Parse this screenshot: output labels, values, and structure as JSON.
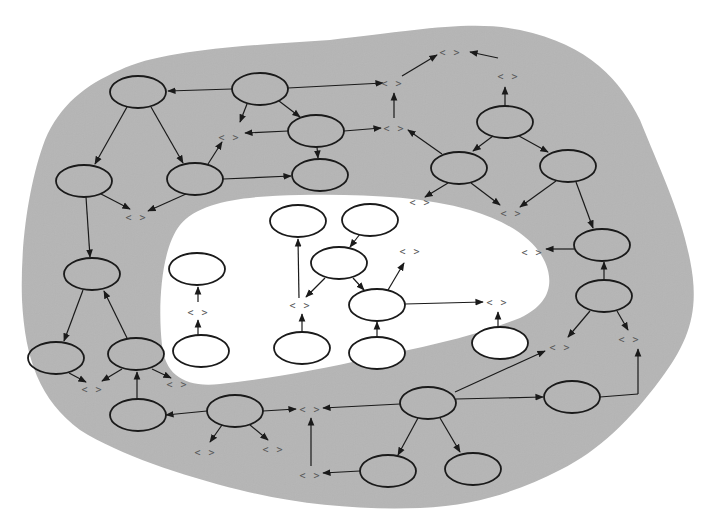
{
  "diagram": {
    "title": "",
    "colors": {
      "outer_region": "#b5b5b5",
      "inner_region": "#ffffff",
      "background": "#ffffff",
      "stroke": "#1a1a1a",
      "terminal_text": "#555555"
    },
    "terminal_label": "< >",
    "regions": [
      {
        "id": "outer",
        "label": "",
        "fill": "#b5b5b5"
      },
      {
        "id": "inner",
        "label": "",
        "fill": "#ffffff"
      }
    ],
    "nodes": [
      {
        "id": "n1",
        "cx": 138,
        "cy": 92,
        "rx": 28,
        "ry": 16,
        "region": "outer"
      },
      {
        "id": "n2",
        "cx": 260,
        "cy": 89,
        "rx": 28,
        "ry": 16,
        "region": "outer"
      },
      {
        "id": "n3",
        "cx": 316,
        "cy": 131,
        "rx": 28,
        "ry": 16,
        "region": "outer"
      },
      {
        "id": "n4",
        "cx": 320,
        "cy": 175,
        "rx": 28,
        "ry": 16,
        "region": "outer"
      },
      {
        "id": "n5",
        "cx": 84,
        "cy": 181,
        "rx": 28,
        "ry": 16,
        "region": "outer"
      },
      {
        "id": "n6",
        "cx": 195,
        "cy": 179,
        "rx": 28,
        "ry": 16,
        "region": "outer"
      },
      {
        "id": "n7",
        "cx": 505,
        "cy": 122,
        "rx": 28,
        "ry": 16,
        "region": "outer"
      },
      {
        "id": "n8",
        "cx": 459,
        "cy": 168,
        "rx": 28,
        "ry": 16,
        "region": "outer"
      },
      {
        "id": "n9",
        "cx": 568,
        "cy": 166,
        "rx": 28,
        "ry": 16,
        "region": "outer"
      },
      {
        "id": "n10",
        "cx": 602,
        "cy": 245,
        "rx": 28,
        "ry": 16,
        "region": "outer"
      },
      {
        "id": "n11",
        "cx": 604,
        "cy": 296,
        "rx": 28,
        "ry": 16,
        "region": "outer"
      },
      {
        "id": "n12",
        "cx": 92,
        "cy": 274,
        "rx": 28,
        "ry": 16,
        "region": "outer"
      },
      {
        "id": "n13",
        "cx": 56,
        "cy": 358,
        "rx": 28,
        "ry": 16,
        "region": "outer"
      },
      {
        "id": "n14",
        "cx": 136,
        "cy": 354,
        "rx": 28,
        "ry": 16,
        "region": "outer"
      },
      {
        "id": "n15",
        "cx": 138,
        "cy": 415,
        "rx": 28,
        "ry": 16,
        "region": "outer"
      },
      {
        "id": "n16",
        "cx": 235,
        "cy": 411,
        "rx": 28,
        "ry": 16,
        "region": "outer"
      },
      {
        "id": "n17",
        "cx": 428,
        "cy": 403,
        "rx": 28,
        "ry": 16,
        "region": "outer"
      },
      {
        "id": "n18",
        "cx": 572,
        "cy": 397,
        "rx": 28,
        "ry": 16,
        "region": "outer"
      },
      {
        "id": "n19",
        "cx": 388,
        "cy": 471,
        "rx": 28,
        "ry": 16,
        "region": "outer"
      },
      {
        "id": "n20",
        "cx": 473,
        "cy": 469,
        "rx": 28,
        "ry": 16,
        "region": "outer"
      },
      {
        "id": "i1",
        "cx": 197,
        "cy": 269,
        "rx": 28,
        "ry": 16,
        "region": "inner"
      },
      {
        "id": "i2",
        "cx": 298,
        "cy": 221,
        "rx": 28,
        "ry": 16,
        "region": "inner"
      },
      {
        "id": "i3",
        "cx": 370,
        "cy": 220,
        "rx": 28,
        "ry": 16,
        "region": "inner"
      },
      {
        "id": "i4",
        "cx": 339,
        "cy": 263,
        "rx": 28,
        "ry": 16,
        "region": "inner"
      },
      {
        "id": "i5",
        "cx": 377,
        "cy": 305,
        "rx": 28,
        "ry": 16,
        "region": "inner"
      },
      {
        "id": "i6",
        "cx": 201,
        "cy": 351,
        "rx": 28,
        "ry": 16,
        "region": "inner"
      },
      {
        "id": "i7",
        "cx": 302,
        "cy": 348,
        "rx": 28,
        "ry": 16,
        "region": "inner"
      },
      {
        "id": "i8",
        "cx": 377,
        "cy": 353,
        "rx": 28,
        "ry": 16,
        "region": "inner"
      },
      {
        "id": "i9",
        "cx": 500,
        "cy": 343,
        "rx": 28,
        "ry": 16,
        "region": "inner"
      }
    ],
    "terminals": [
      {
        "id": "t1",
        "x": 229,
        "y": 137
      },
      {
        "id": "t2",
        "x": 136,
        "y": 217
      },
      {
        "id": "t3",
        "x": 392,
        "y": 83
      },
      {
        "id": "t4",
        "x": 394,
        "y": 128
      },
      {
        "id": "t5",
        "x": 450,
        "y": 52
      },
      {
        "id": "t6",
        "x": 508,
        "y": 76
      },
      {
        "id": "t7",
        "x": 420,
        "y": 202
      },
      {
        "id": "t8",
        "x": 511,
        "y": 213
      },
      {
        "id": "t9",
        "x": 532,
        "y": 252
      },
      {
        "id": "t10",
        "x": 410,
        "y": 251
      },
      {
        "id": "t11",
        "x": 198,
        "y": 312
      },
      {
        "id": "t12",
        "x": 300,
        "y": 305
      },
      {
        "id": "t13",
        "x": 497,
        "y": 302
      },
      {
        "id": "t14",
        "x": 560,
        "y": 347
      },
      {
        "id": "t15",
        "x": 629,
        "y": 339
      },
      {
        "id": "t16",
        "x": 92,
        "y": 389
      },
      {
        "id": "t17",
        "x": 177,
        "y": 384
      },
      {
        "id": "t18",
        "x": 205,
        "y": 452
      },
      {
        "id": "t19",
        "x": 273,
        "y": 449
      },
      {
        "id": "t20",
        "x": 310,
        "y": 409
      },
      {
        "id": "t21",
        "x": 310,
        "y": 475
      }
    ],
    "edges": [
      {
        "from": [
          232,
          89
        ],
        "to": [
          168,
          91
        ]
      },
      {
        "from": [
          288,
          88
        ],
        "to": [
          383,
          83
        ]
      },
      {
        "from": [
          247,
          104
        ],
        "to": [
          240,
          122
        ]
      },
      {
        "from": [
          279,
          101
        ],
        "to": [
          300,
          117
        ]
      },
      {
        "from": [
          288,
          131
        ],
        "to": [
          245,
          133
        ]
      },
      {
        "from": [
          344,
          131
        ],
        "to": [
          381,
          128
        ]
      },
      {
        "from": [
          317,
          147
        ],
        "to": [
          318,
          158
        ]
      },
      {
        "from": [
          127,
          107
        ],
        "to": [
          95,
          164
        ]
      },
      {
        "from": [
          151,
          107
        ],
        "to": [
          183,
          163
        ]
      },
      {
        "from": [
          223,
          179
        ],
        "to": [
          291,
          176
        ]
      },
      {
        "from": [
          208,
          164
        ],
        "to": [
          222,
          142
        ]
      },
      {
        "from": [
          101,
          194
        ],
        "to": [
          130,
          209
        ]
      },
      {
        "from": [
          186,
          194
        ],
        "to": [
          148,
          211
        ]
      },
      {
        "from": [
          86,
          197
        ],
        "to": [
          90,
          257
        ]
      },
      {
        "from": [
          394,
          118
        ],
        "to": [
          394,
          93
        ]
      },
      {
        "from": [
          402,
          76
        ],
        "to": [
          437,
          55
        ]
      },
      {
        "from": [
          505,
          106
        ],
        "to": [
          505,
          87
        ]
      },
      {
        "from": [
          498,
          58
        ],
        "to": [
          470,
          52
        ]
      },
      {
        "from": [
          442,
          154
        ],
        "to": [
          408,
          130
        ]
      },
      {
        "from": [
          493,
          136
        ],
        "to": [
          473,
          151
        ]
      },
      {
        "from": [
          519,
          136
        ],
        "to": [
          548,
          152
        ]
      },
      {
        "from": [
          448,
          183
        ],
        "to": [
          425,
          197
        ]
      },
      {
        "from": [
          471,
          183
        ],
        "to": [
          500,
          205
        ]
      },
      {
        "from": [
          556,
          181
        ],
        "to": [
          520,
          207
        ]
      },
      {
        "from": [
          576,
          182
        ],
        "to": [
          593,
          228
        ]
      },
      {
        "from": [
          574,
          249
        ],
        "to": [
          546,
          249
        ]
      },
      {
        "from": [
          604,
          280
        ],
        "to": [
          604,
          262
        ]
      },
      {
        "from": [
          590,
          311
        ],
        "to": [
          568,
          337
        ]
      },
      {
        "from": [
          617,
          311
        ],
        "to": [
          628,
          330
        ]
      },
      {
        "from": [
          600,
          397
        ],
        "to": [
          638,
          394
        ]
      },
      {
        "from": [
          638,
          394
        ],
        "to": [
          638,
          349
        ]
      },
      {
        "from": [
          456,
          399
        ],
        "to": [
          543,
          397
        ]
      },
      {
        "from": [
          455,
          392
        ],
        "to": [
          545,
          351
        ]
      },
      {
        "from": [
          400,
          404
        ],
        "to": [
          323,
          408
        ]
      },
      {
        "from": [
          418,
          418
        ],
        "to": [
          398,
          455
        ]
      },
      {
        "from": [
          440,
          418
        ],
        "to": [
          460,
          452
        ]
      },
      {
        "from": [
          360,
          471
        ],
        "to": [
          323,
          473
        ]
      },
      {
        "from": [
          311,
          466
        ],
        "to": [
          311,
          418
        ]
      },
      {
        "from": [
          263,
          411
        ],
        "to": [
          296,
          409
        ]
      },
      {
        "from": [
          207,
          411
        ],
        "to": [
          166,
          415
        ]
      },
      {
        "from": [
          222,
          425
        ],
        "to": [
          210,
          442
        ]
      },
      {
        "from": [
          250,
          425
        ],
        "to": [
          268,
          440
        ]
      },
      {
        "from": [
          137,
          399
        ],
        "to": [
          137,
          372
        ]
      },
      {
        "from": [
          83,
          290
        ],
        "to": [
          64,
          341
        ]
      },
      {
        "from": [
          127,
          338
        ],
        "to": [
          104,
          291
        ]
      },
      {
        "from": [
          69,
          373
        ],
        "to": [
          86,
          382
        ]
      },
      {
        "from": [
          122,
          369
        ],
        "to": [
          102,
          381
        ]
      },
      {
        "from": [
          152,
          369
        ],
        "to": [
          171,
          378
        ]
      },
      {
        "from": [
          198,
          335
        ],
        "to": [
          198,
          320
        ]
      },
      {
        "from": [
          198,
          302
        ],
        "to": [
          198,
          287
        ]
      },
      {
        "from": [
          302,
          332
        ],
        "to": [
          302,
          314
        ]
      },
      {
        "from": [
          299,
          298
        ],
        "to": [
          298,
          239
        ]
      },
      {
        "from": [
          325,
          278
        ],
        "to": [
          306,
          297
        ]
      },
      {
        "from": [
          360,
          234
        ],
        "to": [
          350,
          247
        ]
      },
      {
        "from": [
          353,
          278
        ],
        "to": [
          364,
          290
        ]
      },
      {
        "from": [
          388,
          290
        ],
        "to": [
          404,
          263
        ]
      },
      {
        "from": [
          405,
          304
        ],
        "to": [
          483,
          302
        ]
      },
      {
        "from": [
          377,
          337
        ],
        "to": [
          377,
          322
        ]
      },
      {
        "from": [
          498,
          327
        ],
        "to": [
          498,
          312
        ]
      }
    ]
  }
}
